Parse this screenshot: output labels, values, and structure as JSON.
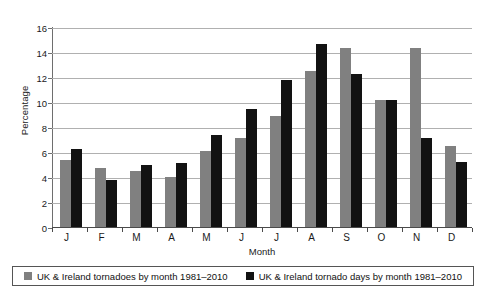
{
  "chart_data": {
    "type": "bar",
    "title": "",
    "xlabel": "Month",
    "ylabel": "Percentage",
    "categories": [
      "J",
      "F",
      "M",
      "A",
      "M",
      "J",
      "J",
      "A",
      "S",
      "O",
      "N",
      "D"
    ],
    "series": [
      {
        "name": "UK & Ireland tornadoes by month 1981–2010",
        "color": "#808080",
        "values": [
          5.35,
          4.75,
          4.5,
          4.0,
          6.1,
          7.1,
          8.85,
          12.45,
          14.35,
          10.15,
          14.3,
          6.5
        ]
      },
      {
        "name": "UK & Ireland tornado days by month 1981–2010",
        "color": "#121212",
        "values": [
          6.25,
          3.75,
          5.0,
          5.1,
          7.35,
          9.45,
          11.8,
          14.65,
          12.25,
          10.15,
          7.1,
          5.2
        ]
      }
    ],
    "ylim": [
      0,
      16
    ],
    "yticks": [
      0,
      2,
      4,
      6,
      8,
      10,
      12,
      14,
      16
    ],
    "grid": true,
    "legend_position": "bottom"
  },
  "legend": {
    "entries": [
      {
        "label": "UK & Ireland tornadoes by month 1981–2010"
      },
      {
        "label": "UK & Ireland tornado days by month 1981–2010"
      }
    ]
  }
}
